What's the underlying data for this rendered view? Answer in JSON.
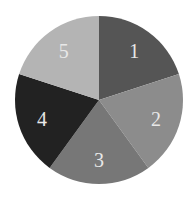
{
  "chart_data": {
    "type": "pie",
    "title": "",
    "categories": [
      "1",
      "2",
      "3",
      "4",
      "5"
    ],
    "values": [
      20,
      20,
      20,
      20,
      20
    ],
    "colors": [
      "#555555",
      "#8c8c8c",
      "#777777",
      "#222222",
      "#b4b4b4"
    ],
    "start_angle_deg": 0,
    "direction": "clockwise",
    "legend": "none",
    "label_color": "#e8e8e8"
  }
}
